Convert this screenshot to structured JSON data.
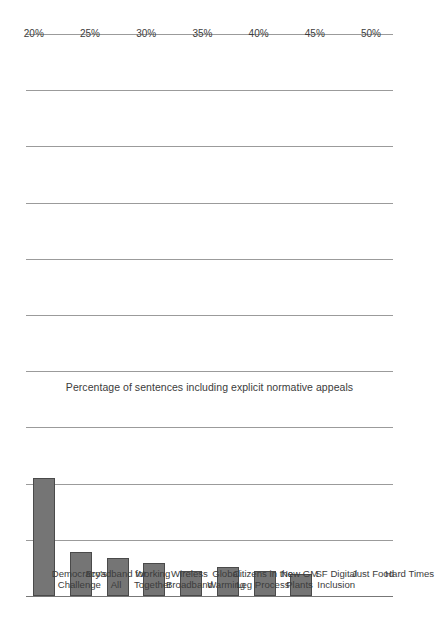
{
  "chart_data": {
    "type": "bar",
    "orientation": "vertical",
    "title": "",
    "subtitle": "",
    "xlabel": "",
    "ylabel": "Percentage of sentences including explicit normative appeals",
    "ylim": [
      0,
      50
    ],
    "ytick_labels": [
      "0%",
      "5%",
      "10%",
      "15%",
      "20%",
      "25%",
      "30%",
      "35%",
      "40%",
      "45%",
      "50%"
    ],
    "ytick_values": [
      0,
      5,
      10,
      15,
      20,
      25,
      30,
      35,
      40,
      45,
      50
    ],
    "grid": true,
    "legend": false,
    "categories": [
      "Hard Times",
      "Just Food",
      "SF Digital Inclusion",
      "New GM Plants",
      "Citizens in the Leg Process",
      "Global Warming",
      "Wireless Broadband",
      "Working Together",
      "Broadband for All",
      "Democracy's Challenge"
    ],
    "category_labels_wrapped": [
      "Hard Times",
      "Just Food",
      "SF Digital\nInclusion",
      "New GM\nPlants",
      "Citizens in the\nLeg Process",
      "Global\nWarming",
      "Wireless\nBroadband",
      "Working\nTogether",
      "Broadband for\nAll",
      "Democracy's\nChallenge"
    ],
    "values": [
      0,
      0,
      2.0,
      2.2,
      2.6,
      2.2,
      2.9,
      3.4,
      3.9,
      10.5
    ],
    "bar_color": "#757575",
    "bar_edge_color": "#4a4a4a",
    "grid_color": "#9b9b9b",
    "axis_color": "#777777"
  },
  "figure": {
    "background": "#ffffff",
    "rotation_note": "landscape"
  }
}
